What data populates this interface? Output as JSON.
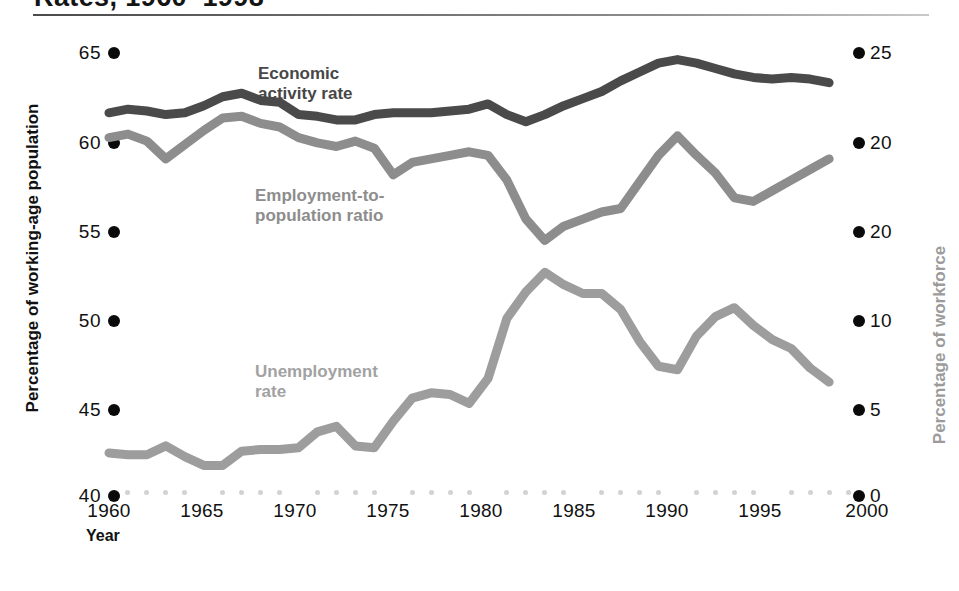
{
  "header": {
    "title": "Rates, 1960–1998",
    "rule": "title-rule"
  },
  "axes": {
    "left_title": "Percentage of working-age population",
    "right_title": "Percentage of workforce",
    "x_title": "Year",
    "left_ticks": [
      "65",
      "60",
      "55",
      "50",
      "45",
      "40"
    ],
    "right_ticks": [
      "25",
      "20",
      "20",
      "10",
      "5",
      "0"
    ],
    "x_ticks": [
      "1960",
      "1965",
      "1970",
      "1975",
      "1980",
      "1985",
      "1990",
      "1995",
      "2000"
    ]
  },
  "series_labels": {
    "economic_activity": "Economic\nactivity rate",
    "economic_activity_line1": "Economic",
    "economic_activity_line2": "activity rate",
    "employment_population": "Employment-to-\npopulation ratio",
    "employment_population_line1": "Employment-to-",
    "employment_population_line2": "population ratio",
    "unemployment": "Unemployment\nrate",
    "unemployment_line1": "Unemployment",
    "unemployment_line2": "rate"
  },
  "colors": {
    "economic_activity": "#4a4a4a",
    "employment_population": "#8d8d8d",
    "unemployment": "#9d9d9d",
    "tick_dot": "#0a0a0a",
    "minor_dot": "#d2d2d2",
    "right_axis_text": "#9b9b9b",
    "background": "#ffffff"
  },
  "chart_data": {
    "type": "line",
    "title": "Rates, 1960–1998",
    "xlabel": "Year",
    "ylabel": "Percentage of working-age population",
    "y2label": "Percentage of workforce",
    "xlim": [
      1960,
      2000
    ],
    "ylim": [
      40,
      65
    ],
    "y2lim": [
      0,
      25
    ],
    "grid": false,
    "legend": "inline-annotations",
    "x": [
      1960,
      1961,
      1962,
      1963,
      1964,
      1965,
      1966,
      1967,
      1968,
      1969,
      1970,
      1971,
      1972,
      1973,
      1974,
      1975,
      1976,
      1977,
      1978,
      1979,
      1980,
      1981,
      1982,
      1983,
      1984,
      1985,
      1986,
      1987,
      1988,
      1989,
      1990,
      1991,
      1992,
      1993,
      1994,
      1995,
      1996,
      1997,
      1998
    ],
    "series": [
      {
        "name": "Economic activity rate",
        "axis": "left",
        "color": "#4a4a4a",
        "unit": "percentage of working-age population",
        "values": [
          61.4,
          61.6,
          61.5,
          61.3,
          61.4,
          61.8,
          62.3,
          62.5,
          62.1,
          62.0,
          61.3,
          61.2,
          61.0,
          61.0,
          61.3,
          61.4,
          61.4,
          61.4,
          61.5,
          61.6,
          61.9,
          61.3,
          60.9,
          61.3,
          61.8,
          62.2,
          62.6,
          63.2,
          63.7,
          64.2,
          64.4,
          64.2,
          63.9,
          63.6,
          63.4,
          63.3,
          63.4,
          63.3,
          63.1
        ]
      },
      {
        "name": "Employment-to-population ratio",
        "axis": "left",
        "color": "#8d8d8d",
        "unit": "percentage of working-age population",
        "values": [
          60.0,
          60.2,
          59.8,
          58.8,
          59.6,
          60.4,
          61.1,
          61.2,
          60.8,
          60.6,
          60.0,
          59.7,
          59.5,
          59.8,
          59.4,
          57.9,
          58.6,
          58.8,
          59.0,
          59.2,
          59.0,
          57.6,
          55.4,
          54.2,
          55.0,
          55.4,
          55.8,
          56.0,
          57.5,
          59.0,
          60.1,
          59.0,
          58.0,
          56.6,
          56.4,
          57.0,
          57.6,
          58.2,
          58.8
        ]
      },
      {
        "name": "Unemployment rate",
        "axis": "right",
        "color": "#9d9d9d",
        "unit": "percentage of workforce",
        "values": [
          2.2,
          2.1,
          2.1,
          2.6,
          2.0,
          1.5,
          1.5,
          2.3,
          2.4,
          2.4,
          2.5,
          3.4,
          3.7,
          2.6,
          2.5,
          4.0,
          5.3,
          5.6,
          5.5,
          5.0,
          6.4,
          9.8,
          11.3,
          12.4,
          11.7,
          11.2,
          11.2,
          10.3,
          8.5,
          7.1,
          6.9,
          8.8,
          9.9,
          10.4,
          9.4,
          8.6,
          8.1,
          7.0,
          6.2
        ]
      }
    ]
  }
}
